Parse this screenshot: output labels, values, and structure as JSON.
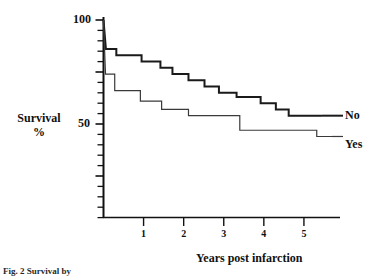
{
  "figure": {
    "caption": "Fig. 2 Survival by",
    "y_axis": {
      "label_main": "Survival",
      "label_unit": "%",
      "labeled_ticks": [
        {
          "value": 100,
          "text": "100"
        },
        {
          "value": 50,
          "text": "50"
        }
      ]
    },
    "x_axis": {
      "label": "Years post infarction",
      "tick_texts": [
        "1",
        "2",
        "3",
        "4",
        "5"
      ]
    },
    "legend": {
      "upper": "No",
      "lower": "Yes"
    }
  },
  "chart_data": {
    "type": "line",
    "title": "",
    "subtitle": "",
    "xlabel": "Years post infarction",
    "ylabel": "Survival %",
    "xlim": [
      0,
      5.9
    ],
    "ylim": [
      0,
      100
    ],
    "xticks": [
      1,
      2,
      3,
      4,
      5
    ],
    "yticks": [
      0,
      5,
      10,
      15,
      20,
      25,
      30,
      35,
      40,
      45,
      50,
      55,
      60,
      65,
      70,
      75,
      80,
      85,
      90,
      95,
      100
    ],
    "ytick_labels": {
      "100": "100",
      "50": "50"
    },
    "grid": false,
    "legend_position": "right-inline",
    "interpolation": "step-post",
    "series": [
      {
        "name": "No",
        "stroke": "#1a1a1a",
        "stroke_width": 2.0,
        "points": [
          {
            "x": 0.0,
            "y": 100
          },
          {
            "x": 0.06,
            "y": 86
          },
          {
            "x": 0.32,
            "y": 86
          },
          {
            "x": 0.32,
            "y": 83
          },
          {
            "x": 0.95,
            "y": 83
          },
          {
            "x": 0.95,
            "y": 80
          },
          {
            "x": 1.42,
            "y": 80
          },
          {
            "x": 1.42,
            "y": 77
          },
          {
            "x": 1.72,
            "y": 77
          },
          {
            "x": 1.72,
            "y": 74
          },
          {
            "x": 2.12,
            "y": 74
          },
          {
            "x": 2.12,
            "y": 71
          },
          {
            "x": 2.52,
            "y": 71
          },
          {
            "x": 2.52,
            "y": 68
          },
          {
            "x": 2.88,
            "y": 68
          },
          {
            "x": 2.88,
            "y": 65
          },
          {
            "x": 3.32,
            "y": 65
          },
          {
            "x": 3.32,
            "y": 63
          },
          {
            "x": 3.92,
            "y": 63
          },
          {
            "x": 3.92,
            "y": 60
          },
          {
            "x": 4.3,
            "y": 60
          },
          {
            "x": 4.3,
            "y": 57
          },
          {
            "x": 4.62,
            "y": 57
          },
          {
            "x": 4.62,
            "y": 54
          },
          {
            "x": 5.45,
            "y": 54
          }
        ]
      },
      {
        "name": "Yes",
        "stroke": "#3a3a3a",
        "stroke_width": 1.2,
        "points": [
          {
            "x": 0.0,
            "y": 100
          },
          {
            "x": 0.05,
            "y": 74
          },
          {
            "x": 0.28,
            "y": 74
          },
          {
            "x": 0.28,
            "y": 66
          },
          {
            "x": 0.92,
            "y": 66
          },
          {
            "x": 0.92,
            "y": 61
          },
          {
            "x": 1.45,
            "y": 61
          },
          {
            "x": 1.45,
            "y": 57
          },
          {
            "x": 2.12,
            "y": 57
          },
          {
            "x": 2.12,
            "y": 54
          },
          {
            "x": 3.4,
            "y": 54
          },
          {
            "x": 3.4,
            "y": 47
          },
          {
            "x": 5.32,
            "y": 47
          },
          {
            "x": 5.32,
            "y": 44
          },
          {
            "x": 5.7,
            "y": 44
          }
        ]
      }
    ],
    "annotations": [
      {
        "text": "No",
        "x": 5.9,
        "y": 54
      },
      {
        "text": "Yes",
        "x": 5.9,
        "y": 44
      }
    ]
  }
}
